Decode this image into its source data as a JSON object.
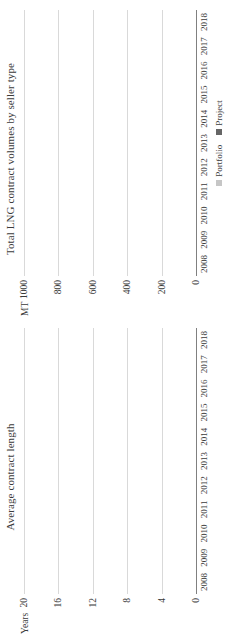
{
  "colors": {
    "portfolio": "#c6c6c6",
    "project": "#666666",
    "single_series": "#666666",
    "gridline": "#d9d9d9",
    "axis": "#808080",
    "text": "#3b3b3b",
    "background": "#ffffff"
  },
  "charts": [
    {
      "title": "Total LNG contract volumes by seller type",
      "unit_label": "MT",
      "legend": [
        {
          "label": "Portfolio",
          "color": "#c6c6c6"
        },
        {
          "label": "Project",
          "color": "#666666"
        }
      ]
    },
    {
      "title": "Average contract length",
      "unit_label": "Years",
      "legend": []
    }
  ],
  "chart_data": [
    {
      "type": "bar",
      "stacked": true,
      "orientation": "vertical",
      "title": "Total LNG contract volumes by seller type",
      "xlabel": "",
      "ylabel": "MT",
      "ylim": [
        0,
        1000
      ],
      "yticks": [
        0,
        200,
        400,
        600,
        800,
        1000
      ],
      "ytick_labels": [
        "0",
        "200",
        "400",
        "600",
        "800",
        "1000"
      ],
      "grid": true,
      "legend_position": "bottom",
      "categories": [
        "2008",
        "2009",
        "2010",
        "2011",
        "2012",
        "2013",
        "2014",
        "2015",
        "2016",
        "2017",
        "2018"
      ],
      "series": [
        {
          "name": "Portfolio",
          "color": "#c6c6c6",
          "values": [
            110,
            110,
            20,
            290,
            140,
            100,
            130,
            220,
            130,
            80,
            140
          ]
        },
        {
          "name": "Project",
          "color": "#666666",
          "values": [
            400,
            395,
            75,
            510,
            800,
            740,
            470,
            110,
            140,
            65,
            410
          ]
        }
      ],
      "totals": [
        510,
        505,
        95,
        800,
        940,
        840,
        600,
        330,
        270,
        145,
        550
      ]
    },
    {
      "type": "bar",
      "stacked": false,
      "orientation": "vertical",
      "title": "Average contract length",
      "xlabel": "",
      "ylabel": "Years",
      "ylim": [
        0,
        20
      ],
      "yticks": [
        0,
        4,
        8,
        12,
        16,
        20
      ],
      "ytick_labels": [
        "0",
        "4",
        "8",
        "12",
        "16",
        "20"
      ],
      "grid": true,
      "legend_position": "none",
      "categories": [
        "2008",
        "2009",
        "2010",
        "2011",
        "2012",
        "2013",
        "2014",
        "2015",
        "2016",
        "2017",
        "2018"
      ],
      "series": [
        {
          "name": "Average contract length",
          "color": "#666666",
          "values": [
            18.0,
            14.0,
            7.5,
            11.7,
            8.2,
            11.6,
            10.0,
            8.4,
            5.5,
            5.5,
            13.1
          ]
        }
      ]
    }
  ]
}
